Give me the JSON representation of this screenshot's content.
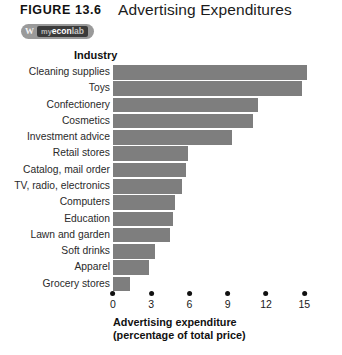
{
  "header": {
    "figure_label": "FIGURE 13.6",
    "title": "Advertising Expenditures",
    "badge": {
      "mark": "W",
      "my": "my",
      "econ": "econ",
      "lab": "lab"
    }
  },
  "chart_data": {
    "type": "bar",
    "orientation": "horizontal",
    "title": "Advertising Expenditures",
    "xlabel": "Advertising expenditure\n(percentage of total price)",
    "xlabel_line1": "Advertising expenditure",
    "xlabel_line2": "(percentage of total price)",
    "ylabel": "Industry",
    "xlim": [
      0,
      15.8
    ],
    "xticks": [
      0,
      3,
      6,
      9,
      12,
      15
    ],
    "xtick_labels": [
      "0",
      "3",
      "6",
      "9",
      "12",
      "15"
    ],
    "grid": false,
    "legend": "none",
    "bar_color": "#7e7e7e",
    "categories": [
      "Cleaning supplies",
      "Toys",
      "Confectionery",
      "Cosmetics",
      "Investment advice",
      "Retail stores",
      "Catalog, mail order",
      "TV, radio, electronics",
      "Computers",
      "Education",
      "Lawn and garden",
      "Soft drinks",
      "Apparel",
      "Grocery stores"
    ],
    "values": [
      15.2,
      14.8,
      11.4,
      11.0,
      9.3,
      5.9,
      5.7,
      5.4,
      4.9,
      4.7,
      4.5,
      3.3,
      2.8,
      1.3
    ]
  }
}
